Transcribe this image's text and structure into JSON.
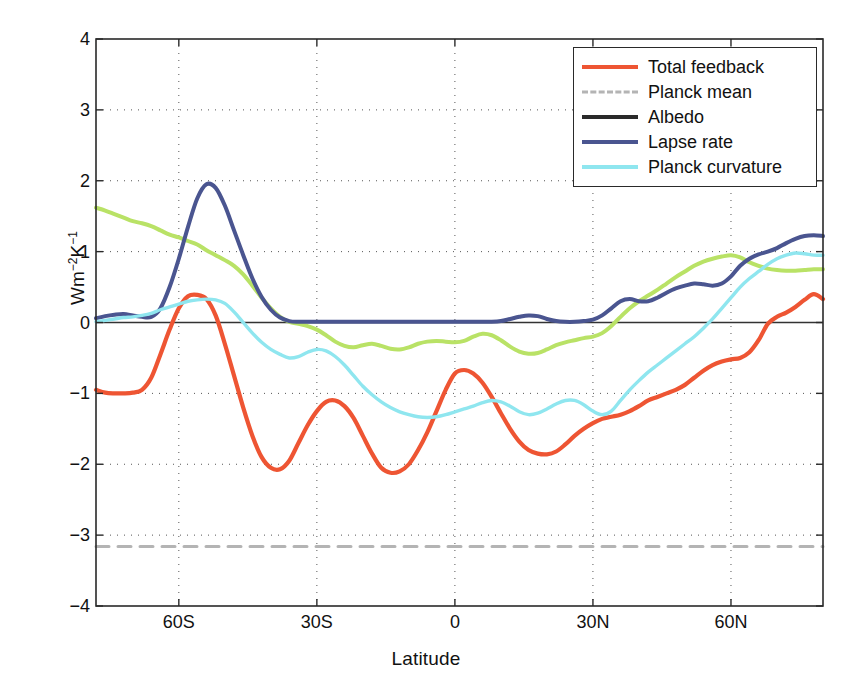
{
  "chart_data": {
    "type": "line",
    "title": "",
    "xlabel": "Latitude",
    "ylabel": "Wm-2K-1",
    "ylabel_parts": {
      "base1": "Wm",
      "sup1": "−2",
      "base2": "K",
      "sup2": "−1"
    },
    "xlim": [
      -78,
      80
    ],
    "ylim": [
      -4,
      4
    ],
    "grid": "dotted",
    "legend_position": "top-right",
    "xticks": [
      -60,
      -30,
      0,
      30,
      60
    ],
    "xticklabels": [
      "60S",
      "30S",
      "0",
      "30N",
      "60N"
    ],
    "yticks": [
      -4,
      -3,
      -2,
      -1,
      0,
      1,
      2,
      3,
      4
    ],
    "yticklabels": [
      "−4",
      "−3",
      "−2",
      "−1",
      "0",
      "1",
      "2",
      "3",
      "4"
    ],
    "colors": {
      "total_feedback": "#ee5533",
      "planck_mean": "#b4b4b4",
      "albedo": "#b9e266",
      "lapse_rate": "#4a5590",
      "planck_curvature": "#8fe6ef",
      "axis": "#2a2a2a",
      "grid": "#555555",
      "background": "#ffffff"
    },
    "series": [
      {
        "name": "Total feedback",
        "color": "#ee5533",
        "style": "solid",
        "width": 4.2,
        "x": [
          -78,
          -76,
          -74,
          -72,
          -70,
          -68,
          -66,
          -64,
          -62,
          -60,
          -58,
          -56,
          -54,
          -52,
          -50,
          -48,
          -46,
          -44,
          -42,
          -40,
          -38,
          -36,
          -34,
          -32,
          -30,
          -28,
          -26,
          -24,
          -22,
          -20,
          -18,
          -16,
          -14,
          -12,
          -10,
          -8,
          -6,
          -4,
          -2,
          0,
          2,
          4,
          6,
          8,
          10,
          12,
          14,
          16,
          18,
          20,
          22,
          24,
          26,
          28,
          30,
          32,
          34,
          36,
          38,
          40,
          42,
          44,
          46,
          48,
          50,
          52,
          54,
          56,
          58,
          60,
          62,
          64,
          66,
          68,
          70,
          72,
          74,
          76,
          78,
          80
        ],
        "y": [
          -0.95,
          -0.99,
          -1.0,
          -1.0,
          -0.99,
          -0.95,
          -0.78,
          -0.45,
          -0.1,
          0.2,
          0.37,
          0.39,
          0.33,
          0.1,
          -0.3,
          -0.75,
          -1.2,
          -1.6,
          -1.9,
          -2.05,
          -2.07,
          -1.95,
          -1.7,
          -1.45,
          -1.25,
          -1.12,
          -1.1,
          -1.18,
          -1.35,
          -1.6,
          -1.85,
          -2.05,
          -2.12,
          -2.1,
          -2.0,
          -1.8,
          -1.55,
          -1.25,
          -0.95,
          -0.72,
          -0.67,
          -0.72,
          -0.85,
          -1.05,
          -1.28,
          -1.5,
          -1.68,
          -1.8,
          -1.85,
          -1.86,
          -1.82,
          -1.72,
          -1.6,
          -1.5,
          -1.42,
          -1.36,
          -1.33,
          -1.3,
          -1.25,
          -1.18,
          -1.1,
          -1.05,
          -1.0,
          -0.95,
          -0.88,
          -0.78,
          -0.68,
          -0.6,
          -0.55,
          -0.52,
          -0.5,
          -0.42,
          -0.25,
          -0.02,
          0.08,
          0.14,
          0.22,
          0.32,
          0.4,
          0.33
        ]
      },
      {
        "name": "Planck mean",
        "color": "#b4b4b4",
        "style": "dashed",
        "width": 3.0,
        "x": [
          -78,
          80
        ],
        "y": [
          -3.16,
          -3.16
        ]
      },
      {
        "name": "Albedo",
        "color": "#b9e266",
        "legend_color": "#2a2a2a",
        "style": "solid",
        "width": 4.0,
        "x": [
          -78,
          -76,
          -74,
          -72,
          -70,
          -68,
          -66,
          -64,
          -62,
          -60,
          -58,
          -56,
          -54,
          -52,
          -50,
          -48,
          -46,
          -44,
          -42,
          -40,
          -38,
          -36,
          -34,
          -32,
          -30,
          -28,
          -26,
          -24,
          -22,
          -20,
          -18,
          -16,
          -14,
          -12,
          -10,
          -8,
          -6,
          -4,
          -2,
          0,
          2,
          4,
          6,
          8,
          10,
          12,
          14,
          16,
          18,
          20,
          22,
          24,
          26,
          28,
          30,
          32,
          34,
          36,
          38,
          40,
          42,
          44,
          46,
          48,
          50,
          52,
          54,
          56,
          58,
          60,
          62,
          64,
          66,
          68,
          70,
          72,
          74,
          76,
          78,
          80
        ],
        "y": [
          1.62,
          1.58,
          1.53,
          1.48,
          1.43,
          1.4,
          1.36,
          1.3,
          1.24,
          1.2,
          1.15,
          1.1,
          1.02,
          0.95,
          0.88,
          0.8,
          0.68,
          0.52,
          0.35,
          0.2,
          0.08,
          0.01,
          -0.02,
          -0.05,
          -0.1,
          -0.18,
          -0.27,
          -0.33,
          -0.35,
          -0.32,
          -0.3,
          -0.33,
          -0.37,
          -0.38,
          -0.35,
          -0.3,
          -0.27,
          -0.26,
          -0.27,
          -0.28,
          -0.26,
          -0.2,
          -0.16,
          -0.18,
          -0.25,
          -0.34,
          -0.41,
          -0.44,
          -0.43,
          -0.38,
          -0.32,
          -0.28,
          -0.25,
          -0.22,
          -0.2,
          -0.15,
          -0.05,
          0.08,
          0.2,
          0.3,
          0.38,
          0.46,
          0.55,
          0.64,
          0.72,
          0.8,
          0.86,
          0.9,
          0.93,
          0.95,
          0.92,
          0.85,
          0.8,
          0.76,
          0.74,
          0.73,
          0.73,
          0.74,
          0.75,
          0.75
        ]
      },
      {
        "name": "Lapse rate",
        "color": "#4a5590",
        "style": "solid",
        "width": 4.0,
        "x": [
          -78,
          -76,
          -74,
          -72,
          -70,
          -68,
          -66,
          -64,
          -62,
          -60,
          -58,
          -56,
          -54,
          -52,
          -50,
          -48,
          -46,
          -44,
          -42,
          -40,
          -38,
          -36,
          -34,
          -32,
          -30,
          -28,
          -26,
          -24,
          -22,
          -20,
          -18,
          -16,
          -14,
          -12,
          -10,
          -8,
          -6,
          -4,
          -2,
          0,
          2,
          4,
          6,
          8,
          10,
          12,
          14,
          16,
          18,
          20,
          22,
          24,
          26,
          28,
          30,
          32,
          34,
          36,
          38,
          40,
          42,
          44,
          46,
          48,
          50,
          52,
          54,
          56,
          58,
          60,
          62,
          64,
          66,
          68,
          70,
          72,
          74,
          76,
          78,
          80
        ],
        "y": [
          0.06,
          0.09,
          0.11,
          0.12,
          0.1,
          0.08,
          0.08,
          0.2,
          0.5,
          0.9,
          1.35,
          1.75,
          1.95,
          1.9,
          1.65,
          1.3,
          0.95,
          0.62,
          0.36,
          0.18,
          0.07,
          0.02,
          0.01,
          0.01,
          0.01,
          0.01,
          0.01,
          0.01,
          0.01,
          0.01,
          0.01,
          0.01,
          0.01,
          0.01,
          0.01,
          0.01,
          0.01,
          0.01,
          0.01,
          0.01,
          0.01,
          0.01,
          0.01,
          0.01,
          0.02,
          0.05,
          0.08,
          0.1,
          0.09,
          0.05,
          0.02,
          0.01,
          0.01,
          0.02,
          0.04,
          0.1,
          0.2,
          0.3,
          0.33,
          0.3,
          0.3,
          0.35,
          0.42,
          0.48,
          0.52,
          0.55,
          0.54,
          0.52,
          0.55,
          0.65,
          0.8,
          0.9,
          0.96,
          1.0,
          1.05,
          1.12,
          1.18,
          1.22,
          1.23,
          1.22
        ]
      },
      {
        "name": "Planck curvature",
        "color": "#8fe6ef",
        "style": "solid",
        "width": 3.4,
        "x": [
          -78,
          -76,
          -74,
          -72,
          -70,
          -68,
          -66,
          -64,
          -62,
          -60,
          -58,
          -56,
          -54,
          -52,
          -50,
          -48,
          -46,
          -44,
          -42,
          -40,
          -38,
          -36,
          -34,
          -32,
          -30,
          -28,
          -26,
          -24,
          -22,
          -20,
          -18,
          -16,
          -14,
          -12,
          -10,
          -8,
          -6,
          -4,
          -2,
          0,
          2,
          4,
          6,
          8,
          10,
          12,
          14,
          16,
          18,
          20,
          22,
          24,
          26,
          28,
          30,
          32,
          34,
          36,
          38,
          40,
          42,
          44,
          46,
          48,
          50,
          52,
          54,
          56,
          58,
          60,
          62,
          64,
          66,
          68,
          70,
          72,
          74,
          76,
          78,
          80
        ],
        "y": [
          0.01,
          0.03,
          0.05,
          0.07,
          0.08,
          0.1,
          0.13,
          0.18,
          0.22,
          0.26,
          0.3,
          0.32,
          0.33,
          0.32,
          0.27,
          0.15,
          0.0,
          -0.15,
          -0.28,
          -0.38,
          -0.45,
          -0.5,
          -0.48,
          -0.42,
          -0.38,
          -0.4,
          -0.48,
          -0.6,
          -0.75,
          -0.9,
          -1.02,
          -1.12,
          -1.2,
          -1.26,
          -1.3,
          -1.33,
          -1.34,
          -1.33,
          -1.3,
          -1.26,
          -1.22,
          -1.18,
          -1.13,
          -1.1,
          -1.12,
          -1.18,
          -1.26,
          -1.3,
          -1.28,
          -1.22,
          -1.15,
          -1.1,
          -1.1,
          -1.16,
          -1.25,
          -1.3,
          -1.25,
          -1.1,
          -0.95,
          -0.82,
          -0.7,
          -0.6,
          -0.5,
          -0.4,
          -0.3,
          -0.2,
          -0.08,
          0.05,
          0.2,
          0.35,
          0.5,
          0.62,
          0.72,
          0.82,
          0.9,
          0.95,
          0.98,
          0.97,
          0.95,
          0.95
        ]
      }
    ],
    "legend_entries": [
      {
        "label": "Total feedback",
        "color": "#ee5533",
        "style": "solid"
      },
      {
        "label": "Planck mean",
        "color": "#b4b4b4",
        "style": "dashed"
      },
      {
        "label": "Albedo",
        "color": "#2a2a2a",
        "style": "solid"
      },
      {
        "label": "Lapse rate",
        "color": "#4a5590",
        "style": "solid"
      },
      {
        "label": "Planck curvature",
        "color": "#8fe6ef",
        "style": "solid"
      }
    ]
  }
}
